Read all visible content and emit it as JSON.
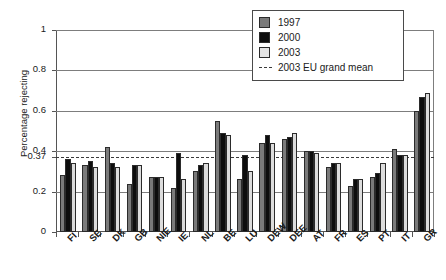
{
  "chart_data": {
    "type": "bar",
    "title": "",
    "xlabel": "",
    "ylabel": "Percentage rejecting",
    "ylim": [
      0,
      1
    ],
    "yticks": [
      0,
      0.2,
      0.37,
      0.4,
      0.6,
      0.8,
      1
    ],
    "ytick_labels": [
      "0",
      "0.2",
      "0.37",
      "0.4",
      "0.6",
      "0.8",
      "1"
    ],
    "grid": true,
    "legend_position": "top-right",
    "categories": [
      "FI",
      "SE",
      "DK",
      "GB",
      "NIE",
      "IE",
      "NL",
      "BE",
      "LU",
      "DEW",
      "DEE",
      "AT",
      "FR",
      "ES",
      "PT",
      "IT",
      "GR"
    ],
    "series": [
      {
        "name": "1997",
        "color": "#7a7a7a",
        "values": [
          0.28,
          0.33,
          0.42,
          0.24,
          0.27,
          0.22,
          0.3,
          0.55,
          0.26,
          0.44,
          0.46,
          0.4,
          0.32,
          0.23,
          0.27,
          0.41,
          0.6
        ]
      },
      {
        "name": "2000",
        "color": "#0d0d0d",
        "values": [
          0.36,
          0.35,
          0.34,
          0.33,
          0.27,
          0.39,
          0.33,
          0.49,
          0.38,
          0.48,
          0.47,
          0.4,
          0.34,
          0.26,
          0.29,
          0.38,
          0.67
        ]
      },
      {
        "name": "2003",
        "color": "#dcdcdc",
        "values": [
          0.34,
          0.32,
          0.32,
          0.33,
          0.27,
          0.26,
          0.34,
          0.48,
          0.3,
          0.44,
          0.49,
          0.39,
          0.34,
          0.26,
          0.34,
          0.38,
          0.69
        ]
      }
    ],
    "reference_line": {
      "label": "2003 EU grand mean",
      "value": 0.37,
      "style": "dashed",
      "color": "#3a3a3a"
    }
  },
  "legend": {
    "items": [
      {
        "label": "1997"
      },
      {
        "label": "2000"
      },
      {
        "label": "2003"
      },
      {
        "label": "2003 EU grand mean"
      }
    ]
  }
}
